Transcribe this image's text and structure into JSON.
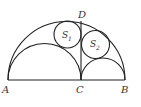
{
  "diagram": {
    "labels": {
      "A": "A",
      "B": "B",
      "C": "C",
      "D": "D",
      "S1": "S",
      "S1_sub": "1",
      "S2": "S",
      "S2_sub": "2"
    },
    "stroke_color": "#222222"
  }
}
